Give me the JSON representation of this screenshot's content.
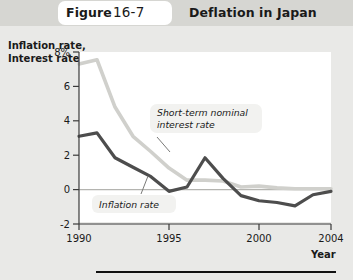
{
  "header": {
    "figure_word": "Figure",
    "figure_number": "16-7",
    "title": "Deflation in Japan"
  },
  "axes": {
    "y_title_line1": "Inflation rate,",
    "y_title_line2": "Interest rate",
    "x_title": "Year"
  },
  "annotations": {
    "interest_label_line1": "Short-term nominal",
    "interest_label_line2": "interest rate",
    "inflation_label": "Inflation rate"
  },
  "colors": {
    "page_background": "#e9e9e7",
    "header_background": "#d6d6d2",
    "plot_background": "#ffffff",
    "inflation_line": "#4d4d4d",
    "interest_line": "#d0d0cc",
    "axis": "#3a3a3a",
    "zero_line": "#b4b4b0",
    "rule": "#111111"
  },
  "chart_data": {
    "type": "line",
    "title": "Deflation in Japan",
    "xlabel": "Year",
    "ylabel": "Inflation rate, Interest rate",
    "xlim": [
      1990,
      2004
    ],
    "ylim": [
      -2,
      8
    ],
    "xticks": [
      1990,
      1995,
      2000,
      2004
    ],
    "xtick_labels": [
      "1990",
      "1995",
      "2000",
      "2004"
    ],
    "yticks": [
      -2,
      0,
      2,
      4,
      6,
      8
    ],
    "ytick_labels": [
      "-2",
      "0",
      "2",
      "4",
      "6",
      "8%"
    ],
    "grid": false,
    "zero_line": true,
    "legend": "inline-annotations",
    "x": [
      1990,
      1991,
      1992,
      1993,
      1994,
      1995,
      1996,
      1997,
      1998,
      1999,
      2000,
      2001,
      2002,
      2003,
      2004
    ],
    "series": [
      {
        "name": "Short-term nominal interest rate",
        "color": "#d0d0cc",
        "values": [
          7.3,
          7.55,
          4.8,
          3.1,
          2.2,
          1.25,
          0.55,
          0.55,
          0.5,
          0.15,
          0.2,
          0.1,
          0.05,
          0.05,
          0.05
        ]
      },
      {
        "name": "Inflation rate",
        "color": "#4d4d4d",
        "values": [
          3.1,
          3.3,
          1.85,
          1.3,
          0.75,
          -0.1,
          0.15,
          1.85,
          0.65,
          -0.35,
          -0.65,
          -0.75,
          -0.95,
          -0.3,
          -0.1
        ]
      }
    ]
  }
}
